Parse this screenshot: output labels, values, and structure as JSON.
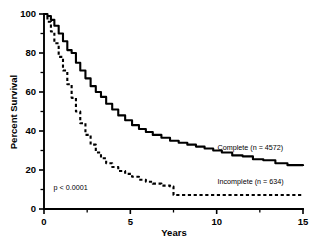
{
  "chart_data": {
    "type": "line",
    "title": "",
    "xlabel": "Years",
    "ylabel": "Percent Survival",
    "xlim": [
      0,
      15
    ],
    "ylim": [
      0,
      100
    ],
    "grid": false,
    "legend_position": "inline-right",
    "x_ticks": [
      0,
      5,
      10,
      15
    ],
    "x_tick_labels": [
      "0",
      "5",
      "10",
      "15"
    ],
    "x_minor_ticks": [
      2.5,
      7.5,
      12.5
    ],
    "y_ticks": [
      0,
      20,
      40,
      60,
      80,
      100
    ],
    "y_tick_labels": [
      "0",
      "20",
      "40",
      "60",
      "80",
      "100"
    ],
    "y_minor_ticks": [
      10,
      30,
      50,
      70,
      90
    ],
    "annotations": [
      {
        "text": "p < 0.0001",
        "x": 0.55,
        "y": 10
      }
    ],
    "series": [
      {
        "name": "Complete (n = 4572)",
        "style": "solid",
        "label_x": 10.05,
        "label_y": 30.5,
        "x": [
          0,
          0.2,
          0.4,
          0.6,
          0.85,
          1.1,
          1.35,
          1.6,
          1.85,
          2.1,
          2.4,
          2.7,
          3.0,
          3.3,
          3.6,
          3.95,
          4.3,
          4.7,
          5.1,
          5.5,
          5.9,
          6.3,
          6.8,
          7.3,
          7.8,
          8.3,
          8.8,
          9.3,
          9.8,
          10.3,
          10.9,
          11.5,
          12.1,
          12.7,
          13.4,
          14.1,
          15.0
        ],
        "y": [
          100,
          99,
          97,
          94,
          90,
          86,
          81.5,
          80,
          75,
          71,
          67,
          63,
          60,
          57.5,
          54,
          51,
          48,
          45.5,
          43,
          41,
          39.5,
          38,
          36.5,
          35,
          34,
          33,
          32,
          31,
          30,
          29,
          27.5,
          27,
          25.5,
          25,
          23.5,
          22.5,
          22
        ]
      },
      {
        "name": "Incomplete (n = 634)",
        "style": "dashed",
        "label_x": 10.05,
        "label_y": 13.0,
        "x": [
          0,
          0.2,
          0.4,
          0.6,
          0.85,
          1.1,
          1.35,
          1.6,
          1.85,
          2.1,
          2.4,
          2.7,
          3.0,
          3.3,
          3.6,
          3.95,
          4.3,
          4.7,
          5.1,
          5.5,
          5.9,
          6.3,
          6.8,
          7.3,
          7.5,
          8.2,
          9.0,
          10.0,
          11.0,
          12.0,
          13.0,
          14.0,
          15.0
        ],
        "y": [
          100,
          96,
          91,
          85,
          78,
          71,
          64,
          57,
          50,
          44,
          38,
          33,
          29,
          26,
          23.5,
          21.5,
          19.5,
          18,
          16.5,
          15,
          14,
          13,
          12,
          11.5,
          7.2,
          7.2,
          7.2,
          7.2,
          7.2,
          7.2,
          7.2,
          7.2,
          7.2
        ]
      }
    ]
  }
}
